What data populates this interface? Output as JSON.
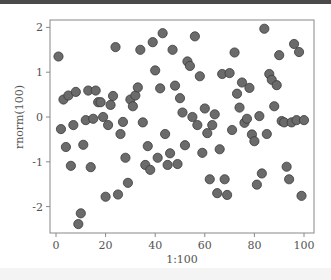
{
  "chart_data": {
    "type": "scatter",
    "title": "",
    "xlabel": "1:100",
    "ylabel": "rnorm(100)",
    "xlim": [
      0,
      100
    ],
    "ylim": [
      -2.5,
      2.1
    ],
    "grid": false,
    "legend": null,
    "x_ticks": [
      0,
      20,
      40,
      60,
      80,
      100
    ],
    "y_ticks": [
      -2,
      -1,
      0,
      1,
      2
    ],
    "x": [
      1,
      2,
      3,
      4,
      5,
      6,
      7,
      8,
      9,
      10,
      11,
      12,
      13,
      14,
      15,
      16,
      17,
      18,
      19,
      20,
      21,
      22,
      23,
      24,
      25,
      26,
      27,
      28,
      29,
      30,
      31,
      32,
      33,
      34,
      35,
      36,
      37,
      38,
      39,
      40,
      41,
      42,
      43,
      44,
      45,
      46,
      47,
      48,
      49,
      50,
      51,
      52,
      53,
      54,
      55,
      56,
      57,
      58,
      59,
      60,
      61,
      62,
      63,
      64,
      65,
      66,
      67,
      68,
      69,
      70,
      71,
      72,
      73,
      74,
      75,
      76,
      77,
      78,
      79,
      80,
      81,
      82,
      83,
      84,
      85,
      86,
      87,
      88,
      89,
      90,
      91,
      92,
      93,
      94,
      95,
      96,
      97,
      98,
      99,
      100
    ],
    "y": [
      1.35,
      -0.27,
      0.39,
      -0.67,
      0.48,
      -1.09,
      -0.18,
      0.56,
      -2.39,
      -2.15,
      -0.62,
      -0.07,
      0.59,
      -1.12,
      -0.04,
      0.59,
      0.33,
      0.33,
      0.0,
      -1.78,
      -0.18,
      0.27,
      0.47,
      1.56,
      -1.73,
      -0.38,
      -0.11,
      -0.91,
      -1.47,
      0.39,
      0.24,
      0.48,
      0.66,
      1.5,
      -0.12,
      -1.07,
      -0.65,
      -1.18,
      1.67,
      1.04,
      -0.91,
      0.64,
      1.87,
      -0.38,
      -1.07,
      -0.81,
      1.5,
      0.7,
      -1.05,
      0.42,
      0.1,
      -0.63,
      1.24,
      1.14,
      0.0,
      1.8,
      -0.18,
      0.91,
      -0.8,
      0.19,
      -0.36,
      -1.39,
      -0.18,
      0.06,
      -1.7,
      -0.72,
      0.96,
      -1.39,
      -1.74,
      0.98,
      -0.29,
      1.44,
      0.52,
      0.21,
      0.77,
      -0.13,
      -0.04,
      0.65,
      -0.39,
      -0.54,
      -1.51,
      0.02,
      -1.26,
      1.97,
      -0.38,
      0.96,
      0.83,
      0.24,
      0.71,
      1.38,
      -0.09,
      -0.12,
      -1.11,
      -1.39,
      -0.12,
      1.63,
      -0.07,
      1.45,
      -1.76,
      -0.07
    ],
    "marker": {
      "shape": "circle",
      "fill": "#6b6b6b",
      "stroke": "#3a3a3a"
    }
  },
  "colors": {
    "frame": "#888888",
    "text": "#555555",
    "point_fill": "#6b6b6b",
    "point_stroke": "#3a3a3a",
    "top_bar": "#4a4a4a"
  }
}
